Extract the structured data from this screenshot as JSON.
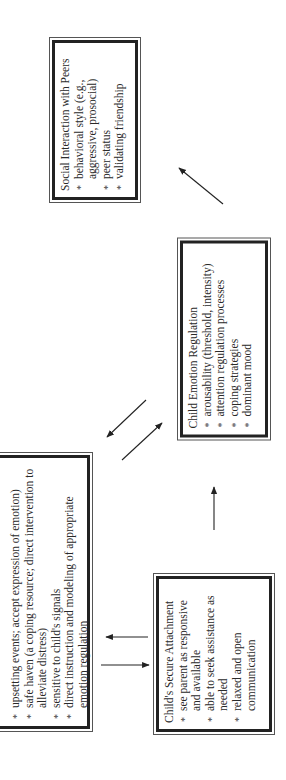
{
  "diagram": {
    "orientation": "rotated-90-ccw",
    "boxes": {
      "parent": {
        "title": "",
        "items": [
          "upsetting events; accept expression of emotion)",
          "safe haven (a coping resource; direct intervention to alleviate distress)",
          "sensitive to child's signals",
          "direct instruction and modeling of appropriate emotion regulation"
        ]
      },
      "attachment": {
        "title": "Child's Secure Attachment",
        "items": [
          "see parent as responsive and available",
          "able to seek assistance as needed",
          "relaxed and open communication"
        ]
      },
      "emotion": {
        "title": "Child Emotion Regulation",
        "items": [
          "arousability (threshold, intensity)",
          "attention regulation processes",
          "coping strategies",
          "dominant mood"
        ]
      },
      "peers": {
        "title": "Social Interaction with Peers",
        "items": [
          "behavioral style (e.g., aggressive, prosocial)",
          "peer status",
          "validating friendship"
        ]
      }
    },
    "arrows": [
      {
        "from": "attachment",
        "to": "parent"
      },
      {
        "from": "parent",
        "to": "attachment"
      },
      {
        "from": "attachment",
        "to": "emotion"
      },
      {
        "from": "emotion",
        "to": "parent"
      },
      {
        "from": "parent",
        "to": "emotion"
      },
      {
        "from": "emotion",
        "to": "peers"
      }
    ],
    "colors": {
      "line": "#222222",
      "background": "#ffffff",
      "text": "#2a2a2a"
    }
  }
}
